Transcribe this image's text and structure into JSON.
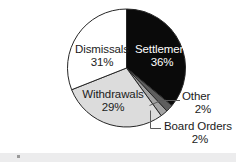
{
  "chart_data": {
    "type": "pie",
    "title": "",
    "subtitle": "",
    "xlabel": "",
    "ylabel": "",
    "legend_position": "none",
    "grid": false,
    "start_angle_deg": 0,
    "direction": "clockwise",
    "units": "percent",
    "categories": [
      "Settlement",
      "Other",
      "Board Orders",
      "Withdrawals",
      "Dismissals"
    ],
    "values": [
      36,
      2,
      2,
      29,
      31
    ],
    "slices": [
      {
        "name": "Settlement",
        "label": "Settlement",
        "value": 36,
        "value_label": "36%",
        "color": "#0a0a0a",
        "text_color": "#ffffff",
        "label_placement": "inside",
        "start_deg": 0,
        "end_deg": 129.6
      },
      {
        "name": "Other",
        "label": "Other",
        "value": 2,
        "value_label": "2%",
        "color": "#5e5e5e",
        "text_color": "#1b1b1b",
        "label_placement": "callout-right",
        "start_deg": 129.6,
        "end_deg": 136.8
      },
      {
        "name": "Board Orders",
        "label": "Board Orders",
        "value": 2,
        "value_label": "2%",
        "color": "#a3a3a3",
        "text_color": "#1b1b1b",
        "label_placement": "callout-below",
        "start_deg": 136.8,
        "end_deg": 144.0
      },
      {
        "name": "Withdrawals",
        "label": "Withdrawals",
        "value": 29,
        "value_label": "29%",
        "color": "#dcdcdc",
        "text_color": "#1b1b1b",
        "label_placement": "inside",
        "start_deg": 144.0,
        "end_deg": 248.4
      },
      {
        "name": "Dismissals",
        "label": "Dismissals",
        "value": 31,
        "value_label": "31%",
        "color": "#ffffff",
        "text_color": "#1b1b1b",
        "label_placement": "inside",
        "start_deg": 248.4,
        "end_deg": 360.0
      }
    ]
  },
  "style": {
    "background": "#ffffff",
    "outline_color": "#262626",
    "leader_color": "#5a5a5a",
    "band_color": "#ececed"
  }
}
